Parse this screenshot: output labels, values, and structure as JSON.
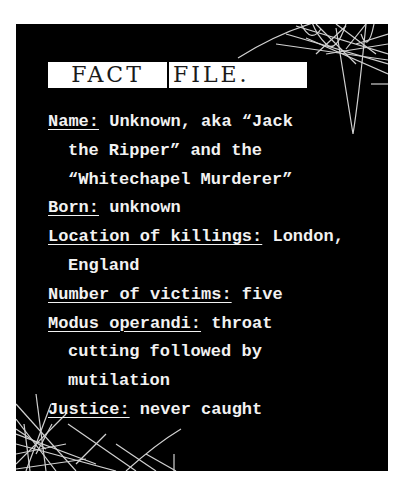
{
  "title": {
    "word1": "FACT",
    "word2": "FILE."
  },
  "facts": {
    "name": {
      "label": "Name:",
      "value_line1": " Unknown, aka “Jack",
      "value_line2": "the Ripper” and the",
      "value_line3": "“Whitechapel Murderer”"
    },
    "born": {
      "label": "Born:",
      "value": " unknown"
    },
    "location": {
      "label": "Location of killings:",
      "value_line1": " London,",
      "value_line2": "England"
    },
    "victims": {
      "label": "Number of victims:",
      "value": " five"
    },
    "modus": {
      "label": "Modus operandi:",
      "value_line1": " throat",
      "value_line2": "cutting followed by",
      "value_line3": "mutilation"
    },
    "justice": {
      "label": "Justice:",
      "value": " never caught"
    }
  },
  "colors": {
    "panel": "#000000",
    "text": "#f2f2f2",
    "title_box": "#ffffff",
    "title_text": "#1a1a1a"
  }
}
